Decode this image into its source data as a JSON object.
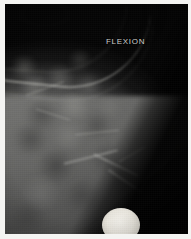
{
  "figure": {
    "name": "radiograph",
    "modality": "x-ray",
    "frame_color": "#ffffff",
    "background_color": "#050505",
    "tissue_color": "#757574",
    "marker_color": "#f2f0ea",
    "label_color": "#cfcfcb"
  },
  "annotations": {
    "position_label": "FLEXION"
  },
  "regions": {
    "air_background": "air-background",
    "soft_tissue": "soft-tissue-mass",
    "skin_line": "skin-line",
    "radiopaque_marker": "radiopaque-marker"
  },
  "texture": {
    "mottles": [
      {
        "x": 12,
        "y": 70,
        "w": 34,
        "h": 26,
        "c": "rgba(162,162,158,0.40)"
      },
      {
        "x": 40,
        "y": 62,
        "w": 30,
        "h": 24,
        "c": "rgba(150,150,146,0.34)"
      },
      {
        "x": 18,
        "y": 96,
        "w": 38,
        "h": 30,
        "c": "rgba(40,40,40,0.40)"
      },
      {
        "x": 52,
        "y": 88,
        "w": 34,
        "h": 28,
        "c": "rgba(170,170,164,0.36)"
      },
      {
        "x": 70,
        "y": 70,
        "w": 28,
        "h": 24,
        "c": "rgba(152,152,148,0.30)"
      },
      {
        "x": 6,
        "y": 120,
        "w": 40,
        "h": 30,
        "c": "rgba(36,36,36,0.38)"
      },
      {
        "x": 46,
        "y": 118,
        "w": 36,
        "h": 28,
        "c": "rgba(158,158,154,0.30)"
      },
      {
        "x": 30,
        "y": 146,
        "w": 42,
        "h": 32,
        "c": "rgba(34,34,34,0.42)"
      },
      {
        "x": 76,
        "y": 108,
        "w": 32,
        "h": 26,
        "c": "rgba(44,44,44,0.36)"
      },
      {
        "x": 84,
        "y": 140,
        "w": 38,
        "h": 30,
        "c": "rgba(40,40,40,0.38)"
      },
      {
        "x": 14,
        "y": 172,
        "w": 44,
        "h": 34,
        "c": "rgba(150,150,146,0.26)"
      },
      {
        "x": 58,
        "y": 176,
        "w": 40,
        "h": 32,
        "c": "rgba(38,38,38,0.34)"
      },
      {
        "x": 100,
        "y": 162,
        "w": 36,
        "h": 30,
        "c": "rgba(46,46,46,0.34)"
      },
      {
        "x": 118,
        "y": 186,
        "w": 40,
        "h": 34,
        "c": "rgba(42,42,42,0.32)"
      },
      {
        "x": 4,
        "y": 52,
        "w": 30,
        "h": 22,
        "c": "rgba(176,176,170,0.30)"
      },
      {
        "x": 62,
        "y": 46,
        "w": 26,
        "h": 20,
        "c": "rgba(140,140,136,0.26)"
      },
      {
        "x": 92,
        "y": 92,
        "w": 26,
        "h": 22,
        "c": "rgba(140,140,136,0.24)"
      },
      {
        "x": 140,
        "y": 170,
        "w": 34,
        "h": 28,
        "c": "rgba(36,36,36,0.30)"
      },
      {
        "x": 150,
        "y": 200,
        "w": 36,
        "h": 30,
        "c": "rgba(40,40,40,0.28)"
      },
      {
        "x": 2,
        "y": 196,
        "w": 42,
        "h": 34,
        "c": "rgba(42,42,42,0.30)"
      }
    ],
    "streaks": [
      {
        "x": 58,
        "y": 152,
        "w": 56,
        "h": 2,
        "r": -14
      },
      {
        "x": 86,
        "y": 160,
        "w": 50,
        "h": 2,
        "r": 26
      },
      {
        "x": 70,
        "y": 128,
        "w": 44,
        "h": 1,
        "r": -6
      },
      {
        "x": 100,
        "y": 176,
        "w": 40,
        "h": 2,
        "r": 34
      },
      {
        "x": 30,
        "y": 110,
        "w": 36,
        "h": 1,
        "r": 18
      },
      {
        "x": 112,
        "y": 150,
        "w": 30,
        "h": 1,
        "r": -30
      },
      {
        "x": 20,
        "y": 84,
        "w": 40,
        "h": 1,
        "r": -20
      }
    ]
  }
}
